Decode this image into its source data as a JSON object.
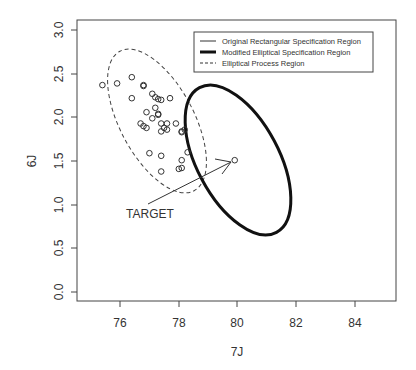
{
  "chart_data": {
    "type": "scatter",
    "title": "",
    "xlabel": "7J",
    "ylabel": "6J",
    "xlim": [
      74.6,
      85.4
    ],
    "ylim": [
      -0.1,
      3.1
    ],
    "xticks": [
      "76",
      "78",
      "80",
      "82",
      "84"
    ],
    "yticks": [
      "0.0",
      "0.5",
      "1.0",
      "1.5",
      "2.0",
      "2.5",
      "3.0"
    ],
    "grid": false,
    "legend_position": "top-right",
    "legend": [
      {
        "label": "Original Rectangular Specification Region",
        "style": "thin-solid"
      },
      {
        "label": "Modified Elliptical Specification Region",
        "style": "thick-solid"
      },
      {
        "label": "Elliptical Process Region",
        "style": "dashed"
      }
    ],
    "annotation": {
      "text": "TARGET",
      "target": {
        "x": 79.9,
        "y": 1.51
      }
    },
    "series": [
      {
        "name": "Observations",
        "points": [
          {
            "x": 75.4,
            "y": 2.37
          },
          {
            "x": 75.9,
            "y": 2.39
          },
          {
            "x": 76.4,
            "y": 2.46
          },
          {
            "x": 76.8,
            "y": 2.36
          },
          {
            "x": 76.8,
            "y": 2.37
          },
          {
            "x": 76.4,
            "y": 2.22
          },
          {
            "x": 77.1,
            "y": 2.27
          },
          {
            "x": 77.2,
            "y": 2.23
          },
          {
            "x": 77.3,
            "y": 2.21
          },
          {
            "x": 77.4,
            "y": 2.2
          },
          {
            "x": 77.7,
            "y": 2.22
          },
          {
            "x": 76.9,
            "y": 2.06
          },
          {
            "x": 77.2,
            "y": 2.11
          },
          {
            "x": 77.3,
            "y": 2.04
          },
          {
            "x": 77.3,
            "y": 2.03
          },
          {
            "x": 77.1,
            "y": 1.99
          },
          {
            "x": 76.7,
            "y": 1.93
          },
          {
            "x": 76.8,
            "y": 1.9
          },
          {
            "x": 76.9,
            "y": 1.88
          },
          {
            "x": 77.4,
            "y": 1.93
          },
          {
            "x": 77.6,
            "y": 1.93
          },
          {
            "x": 77.9,
            "y": 1.93
          },
          {
            "x": 77.5,
            "y": 1.88
          },
          {
            "x": 77.6,
            "y": 1.86
          },
          {
            "x": 77.4,
            "y": 1.84
          },
          {
            "x": 78.1,
            "y": 1.84
          },
          {
            "x": 78.2,
            "y": 1.86
          },
          {
            "x": 78.1,
            "y": 1.83
          },
          {
            "x": 77.0,
            "y": 1.59
          },
          {
            "x": 77.4,
            "y": 1.56
          },
          {
            "x": 78.1,
            "y": 1.51
          },
          {
            "x": 78.3,
            "y": 1.6
          },
          {
            "x": 77.4,
            "y": 1.38
          },
          {
            "x": 78.0,
            "y": 1.41
          },
          {
            "x": 78.1,
            "y": 1.42
          },
          {
            "x": 79.9,
            "y": 1.51
          }
        ]
      }
    ],
    "regions": [
      {
        "name": "Modified Elliptical Specification Region",
        "center": [
          80.0,
          1.51
        ],
        "style": "thick-solid"
      },
      {
        "name": "Elliptical Process Region",
        "center": [
          77.2,
          1.95
        ],
        "style": "dashed"
      }
    ]
  }
}
